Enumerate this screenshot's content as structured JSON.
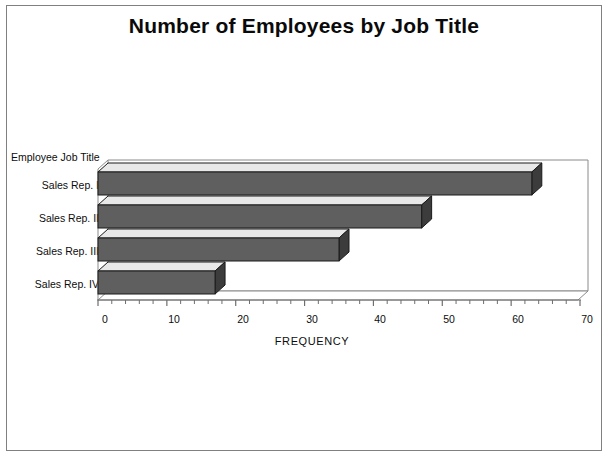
{
  "chart_data": {
    "type": "bar",
    "orientation": "horizontal",
    "style": "3d",
    "title": "Number of Employees by Job Title",
    "categories": [
      "Sales Rep. I",
      "Sales Rep. II",
      "Sales Rep. III",
      "Sales Rep. IV"
    ],
    "values": [
      63,
      47,
      35,
      17
    ],
    "category_axis_title": "Employee Job Title",
    "xlabel": "FREQUENCY",
    "ylabel": "Employee Job Title",
    "xlim": [
      0,
      70
    ],
    "xticks": [
      0,
      10,
      20,
      30,
      40,
      50,
      60,
      70
    ],
    "xtick_labels": [
      "0",
      "10",
      "20",
      "30",
      "40",
      "50",
      "60",
      "70"
    ],
    "minor_tick_step": 2,
    "grid": false,
    "legend": false,
    "colors": {
      "bar_front": "#5f5f5f",
      "bar_top": "#e8e8e8",
      "bar_side": "#3c3c3c",
      "bar_outline": "#1a1a1a",
      "axis": "#6e6e6e",
      "frame": "#8a8a8a",
      "text": "#0d0d0d",
      "background": "#ffffff"
    }
  }
}
